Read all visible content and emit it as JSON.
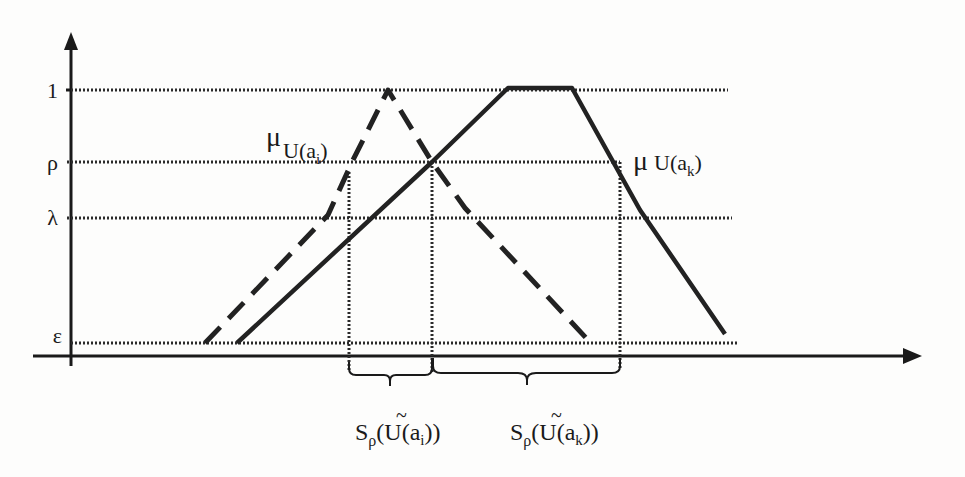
{
  "figure": {
    "type": "fuzzy membership functions with rho-level support intervals",
    "axes": {
      "y_arrow": true,
      "x_arrow": true
    },
    "y_levels": [
      {
        "id": "one",
        "label": "1",
        "y": 90
      },
      {
        "id": "rho",
        "label": "ρ",
        "y": 162
      },
      {
        "id": "lambda",
        "label": "λ",
        "y": 218
      },
      {
        "id": "epsilon",
        "label": "ε",
        "y": 343
      }
    ],
    "curves": [
      {
        "id": "mu_U_ai",
        "label_main": "μ",
        "label_sub": "U(a",
        "label_subsub": "i",
        "label_close": ")",
        "style": "dashed",
        "shape": "triangular",
        "points": [
          [
            205,
            343
          ],
          [
            328,
            215
          ],
          [
            353,
            160
          ],
          [
            388,
            90
          ],
          [
            432,
            162
          ],
          [
            465,
            208
          ],
          [
            588,
            340
          ]
        ]
      },
      {
        "id": "mu_U_ak",
        "label_main": "μ",
        "label_sub": "U(a",
        "label_subsub": "k",
        "label_close": ")",
        "style": "solid",
        "shape": "trapezoidal",
        "points": [
          [
            237,
            343
          ],
          [
            432,
            162
          ],
          [
            508,
            88
          ],
          [
            572,
            88
          ],
          [
            640,
            210
          ],
          [
            725,
            334
          ]
        ]
      }
    ],
    "support_intervals": [
      {
        "id": "S_rho_U_ai",
        "label_S": "S",
        "label_sub": "ρ",
        "label_open": "(",
        "label_U": "U",
        "label_tilde": "~",
        "label_arg": "(a",
        "label_argsub": "i",
        "label_close": "))",
        "x_start": 349,
        "x_end": 432
      },
      {
        "id": "S_rho_U_ak",
        "label_S": "S",
        "label_sub": "ρ",
        "label_open": "(",
        "label_U": "U",
        "label_tilde": "~",
        "label_arg": "(a",
        "label_argsub": "k",
        "label_close": "))",
        "x_start": 432,
        "x_end": 620
      }
    ],
    "colors": {
      "ink": "#1a1a1a",
      "paper": "#fdfdfc"
    }
  }
}
